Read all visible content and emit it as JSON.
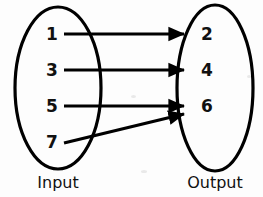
{
  "diagram": {
    "type": "mapping-diagram",
    "stroke_color": "#000000",
    "background_color": "#fdfdfd",
    "input_set": {
      "label": "Input",
      "elements": [
        {
          "value": "1",
          "x": 52,
          "y": 40
        },
        {
          "value": "3",
          "x": 52,
          "y": 76
        },
        {
          "value": "5",
          "x": 52,
          "y": 112
        },
        {
          "value": "7",
          "x": 52,
          "y": 148
        }
      ],
      "ellipse": {
        "cx": 58,
        "cy": 88,
        "rx": 43,
        "ry": 81
      },
      "label_x": 58,
      "label_y": 188
    },
    "output_set": {
      "label": "Output",
      "elements": [
        {
          "value": "2",
          "x": 207,
          "y": 40
        },
        {
          "value": "4",
          "x": 207,
          "y": 76
        },
        {
          "value": "6",
          "x": 207,
          "y": 112
        }
      ],
      "ellipse": {
        "cx": 215,
        "cy": 88,
        "rx": 38,
        "ry": 83
      },
      "label_x": 215,
      "label_y": 188
    },
    "mappings": [
      {
        "from": "1",
        "to": "2",
        "x1": 64,
        "y1": 34,
        "x2": 184,
        "y2": 34
      },
      {
        "from": "3",
        "to": "4",
        "x1": 64,
        "y1": 70,
        "x2": 184,
        "y2": 70
      },
      {
        "from": "5",
        "to": "6",
        "x1": 64,
        "y1": 106,
        "x2": 184,
        "y2": 106
      },
      {
        "from": "7",
        "to": "6",
        "x1": 64,
        "y1": 143,
        "x2": 184,
        "y2": 114
      }
    ]
  }
}
